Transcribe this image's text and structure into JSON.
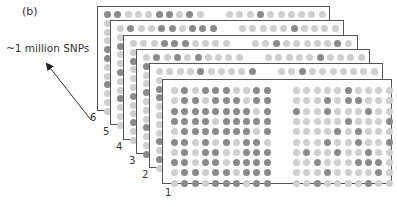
{
  "panel_label": "(b)",
  "snp_label": "~1 million SNPs",
  "colors": {
    "light_dot": "#cfcfcf",
    "dark_dot": "#8a8a8a",
    "border": "#555555"
  },
  "cards": [
    {
      "number": "6",
      "left": 97,
      "top": 6,
      "width": 233,
      "height": 105,
      "top_row": {
        "left": "DDLLLDDLDL",
        "right": "LLLDLLLLLL"
      },
      "left_col": "DLLLDDLLDLLL"
    },
    {
      "number": "5",
      "left": 110,
      "top": 20,
      "width": 234,
      "height": 105,
      "top_row": {
        "left": "LDLLDDLDDD",
        "right": "LLLLLDLLLL"
      },
      "left_col": "LLDLLDLLDLLL"
    },
    {
      "number": "4",
      "left": 123,
      "top": 35,
      "width": 235,
      "height": 105,
      "top_row": {
        "left": "LLLDDDLLLL",
        "right": "LLDLLLLLDL"
      },
      "left_col": "LLDLLLDLLDLL"
    },
    {
      "number": "3",
      "left": 136,
      "top": 49,
      "width": 234,
      "height": 105,
      "top_row": {
        "left": "LDLDLDLLLL",
        "right": "LLLLLDLLLL"
      },
      "left_col": "LDLLDLLLDLLD"
    },
    {
      "number": "2",
      "left": 149,
      "top": 63,
      "width": 234,
      "height": 105,
      "top_row": {
        "left": "LLLLDLLLLD",
        "right": "LLDLLLLLLL"
      },
      "left_col": "LLDDLLLLDLDL"
    },
    {
      "number": "1",
      "left": 162,
      "top": 79,
      "width": 230,
      "height": 105,
      "grid": {
        "left": [
          "LDLDDDLLDD",
          "LDDLDDDLDD",
          "DDDDDDDDLD",
          "DDDDLDDDDD",
          "LDDDDDDDLD",
          "DDLDLDLDDL",
          "LDLDDLLDDD",
          "DDLDDLDDDD",
          "LDDLDDLDDD",
          "LDDLDDDLDD"
        ],
        "right": [
          "LLLLLDLLLL",
          "LLLDLDDLLL",
          "DLLDLLLDLL",
          "LLLLLDLLLD",
          "LLLLDLDLLL",
          "LLLDLLDLLD",
          "LDLLDLLDLL",
          "LLDLLLDDDL",
          "LLLDLLLLDL",
          "LLDLLLLDLL"
        ]
      }
    }
  ],
  "arrow": {
    "from": [
      91,
      120
    ],
    "to": [
      45,
      62
    ]
  }
}
